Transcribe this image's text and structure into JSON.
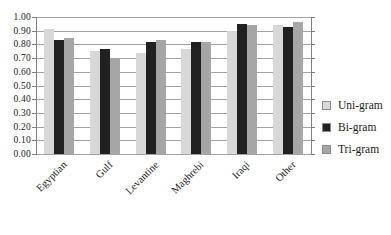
{
  "chart_data": {
    "type": "bar",
    "title": "",
    "xlabel": "",
    "ylabel": "",
    "categories": [
      "Egyptian",
      "Gulf",
      "Levantine",
      "Maghrebi",
      "Iraqi",
      "Other"
    ],
    "series": [
      {
        "name": "Uni-gram",
        "color": "#d8d8d8",
        "values": [
          0.91,
          0.75,
          0.74,
          0.77,
          0.9,
          0.94
        ]
      },
      {
        "name": "Bi-gram",
        "color": "#212121",
        "values": [
          0.83,
          0.77,
          0.82,
          0.82,
          0.95,
          0.93
        ]
      },
      {
        "name": "Tri-gram",
        "color": "#a6a6a6",
        "values": [
          0.85,
          0.7,
          0.83,
          0.82,
          0.94,
          0.96
        ]
      }
    ],
    "ylim": [
      0.0,
      1.0
    ],
    "ytick_step": 0.1,
    "ytick_labels": [
      "0.00",
      "0.10",
      "0.20",
      "0.30",
      "0.40",
      "0.50",
      "0.60",
      "0.70",
      "0.80",
      "0.90",
      "1.00"
    ],
    "grid": true,
    "legend_position": "right"
  },
  "colors": {
    "background": "#ffffff",
    "gridline": "#a3a3a3",
    "axis": "#808080",
    "text": "#1a1a1a"
  }
}
